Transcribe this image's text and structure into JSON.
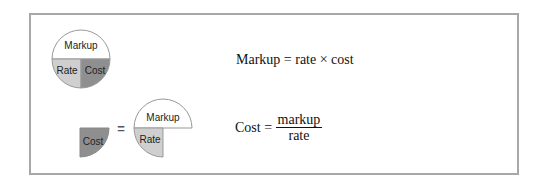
{
  "diagram": {
    "top_pie": {
      "segments": [
        {
          "label": "Markup",
          "color": "#ffffff"
        },
        {
          "label": "Rate",
          "color": "#cfcfcf"
        },
        {
          "label": "Cost",
          "color": "#8f8f8f"
        }
      ]
    },
    "bottom": {
      "left_segment": {
        "label": "Cost",
        "color": "#8f8f8f"
      },
      "equals_sign": "=",
      "right_pie": {
        "segments": [
          {
            "label": "Markup",
            "color": "#ffffff"
          },
          {
            "label": "Rate",
            "color": "#cfcfcf"
          }
        ]
      }
    }
  },
  "formulas": {
    "formula1": {
      "lhs": "Markup",
      "equals": "=",
      "rhs": "rate × cost"
    },
    "formula2": {
      "lhs": "Cost",
      "equals": "=",
      "numerator": "markup",
      "denominator": "rate"
    }
  },
  "colors": {
    "border": "#a8a8a8",
    "light": "#cfcfcf",
    "dark": "#8f8f8f"
  }
}
